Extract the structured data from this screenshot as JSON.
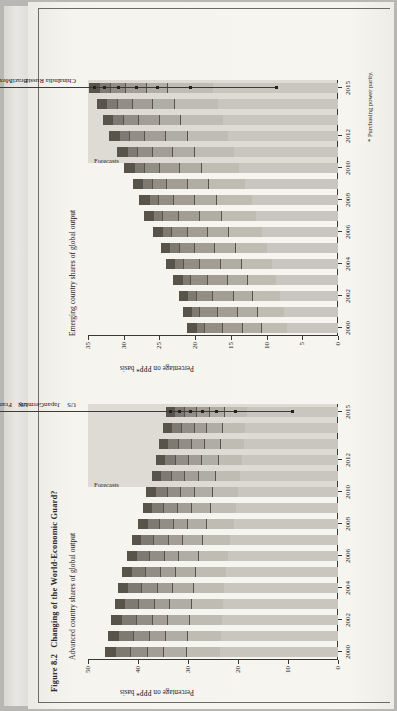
{
  "figure": {
    "number": "Figure 8.2",
    "caption": "Changing of the World-Economic Guard?"
  },
  "footnote": "* Purchasing power parity.",
  "panels": {
    "advanced": {
      "title": "Advanced country shares of global output",
      "ylabel": "Percentage on PPP* basis",
      "forecast_label": "Forecasts"
    },
    "emerging": {
      "title": "Emerging country shares of global output",
      "ylabel": "Percentage on PPP* basis",
      "forecast_label": "Forecasts"
    }
  },
  "chart_data": [
    {
      "id": "advanced",
      "type": "bar",
      "stacked": true,
      "title": "Advanced country shares of global output",
      "xlabel": "",
      "ylabel": "Percentage on PPP* basis",
      "ylim": [
        0,
        50
      ],
      "yticks": [
        0,
        10,
        20,
        30,
        40,
        50
      ],
      "grid": false,
      "legend": "leader-lines",
      "forecast_from": 2011,
      "x": [
        2000,
        2001,
        2002,
        2003,
        2004,
        2005,
        2006,
        2007,
        2008,
        2009,
        2010,
        2011,
        2012,
        2013,
        2014,
        2015
      ],
      "xticks": [
        2000,
        2002,
        2004,
        2006,
        2008,
        2010,
        2012,
        2015
      ],
      "categories": [
        "US",
        "Japan",
        "Germany",
        "UK",
        "France",
        "Italy",
        "Canada"
      ],
      "series": [
        {
          "name": "US",
          "values": [
            23.6,
            23.5,
            23.3,
            23.1,
            22.8,
            22.5,
            22.1,
            21.6,
            20.9,
            20.4,
            20.1,
            19.6,
            19.2,
            18.9,
            18.6,
            18.3
          ]
        },
        {
          "name": "Japan",
          "values": [
            6.9,
            6.7,
            6.5,
            6.4,
            6.3,
            6.1,
            5.9,
            5.7,
            5.5,
            5.3,
            5.2,
            5.0,
            4.8,
            4.7,
            4.6,
            4.5
          ]
        },
        {
          "name": "Germany",
          "values": [
            4.6,
            4.5,
            4.4,
            4.3,
            4.2,
            4.1,
            4.0,
            3.9,
            3.8,
            3.7,
            3.6,
            3.5,
            3.4,
            3.3,
            3.2,
            3.1
          ]
        },
        {
          "name": "UK",
          "values": [
            3.2,
            3.2,
            3.1,
            3.1,
            3.0,
            3.0,
            2.9,
            2.9,
            2.8,
            2.8,
            2.7,
            2.7,
            2.6,
            2.6,
            2.5,
            2.5
          ]
        },
        {
          "name": "France",
          "values": [
            3.3,
            3.2,
            3.2,
            3.1,
            3.1,
            3.0,
            2.9,
            2.9,
            2.8,
            2.8,
            2.7,
            2.6,
            2.6,
            2.5,
            2.5,
            2.4
          ]
        },
        {
          "name": "Italy",
          "values": [
            3.1,
            3.0,
            3.0,
            2.9,
            2.8,
            2.7,
            2.6,
            2.6,
            2.5,
            2.4,
            2.4,
            2.3,
            2.2,
            2.2,
            2.1,
            2.1
          ]
        },
        {
          "name": "Canada",
          "values": [
            1.9,
            1.9,
            1.9,
            1.8,
            1.8,
            1.8,
            1.8,
            1.7,
            1.7,
            1.7,
            1.7,
            1.6,
            1.6,
            1.6,
            1.6,
            1.5
          ]
        }
      ],
      "totals": [
        46.6,
        46.0,
        45.4,
        44.7,
        44.0,
        43.2,
        42.2,
        41.3,
        40.0,
        39.1,
        38.4,
        37.3,
        36.4,
        35.8,
        35.1,
        34.4
      ]
    },
    {
      "id": "emerging",
      "type": "bar",
      "stacked": true,
      "title": "Emerging country shares of global output",
      "xlabel": "",
      "ylabel": "Percentage on PPP* basis",
      "ylim": [
        0,
        35
      ],
      "yticks": [
        0,
        5,
        10,
        15,
        20,
        25,
        30,
        35
      ],
      "grid": false,
      "legend": "leader-lines",
      "forecast_from": 2011,
      "x": [
        2000,
        2001,
        2002,
        2003,
        2004,
        2005,
        2006,
        2007,
        2008,
        2009,
        2010,
        2011,
        2012,
        2013,
        2014,
        2015
      ],
      "xticks": [
        2000,
        2002,
        2004,
        2006,
        2008,
        2010,
        2012,
        2015
      ],
      "categories": [
        "China",
        "India",
        "Russia",
        "Brazil",
        "Mexico",
        "Indonesia",
        "Turkey"
      ],
      "series": [
        {
          "name": "China",
          "values": [
            7.1,
            7.6,
            8.1,
            8.7,
            9.3,
            9.9,
            10.7,
            11.5,
            12.1,
            13.0,
            13.8,
            14.6,
            15.4,
            16.1,
            16.8,
            17.5
          ]
        },
        {
          "name": "India",
          "values": [
            3.7,
            3.8,
            3.9,
            4.1,
            4.3,
            4.5,
            4.7,
            4.9,
            5.0,
            5.2,
            5.4,
            5.6,
            5.8,
            6.0,
            6.2,
            6.4
          ]
        },
        {
          "name": "Russia",
          "values": [
            2.6,
            2.7,
            2.7,
            2.8,
            2.9,
            2.9,
            3.0,
            3.1,
            3.1,
            3.0,
            3.0,
            3.0,
            3.0,
            3.0,
            3.0,
            3.0
          ]
        },
        {
          "name": "Brazil",
          "values": [
            2.9,
            2.9,
            2.9,
            2.8,
            2.9,
            2.8,
            2.8,
            2.9,
            2.9,
            2.9,
            2.9,
            2.9,
            2.9,
            2.9,
            2.9,
            2.9
          ]
        },
        {
          "name": "Mexico",
          "values": [
            2.4,
            2.4,
            2.3,
            2.3,
            2.3,
            2.2,
            2.2,
            2.2,
            2.1,
            2.0,
            2.1,
            2.1,
            2.1,
            2.1,
            2.1,
            2.1
          ]
        },
        {
          "name": "Indonesia",
          "values": [
            1.2,
            1.2,
            1.2,
            1.2,
            1.2,
            1.3,
            1.3,
            1.3,
            1.3,
            1.4,
            1.4,
            1.4,
            1.5,
            1.5,
            1.5,
            1.6
          ]
        },
        {
          "name": "Turkey",
          "values": [
            1.2,
            1.1,
            1.1,
            1.2,
            1.2,
            1.2,
            1.2,
            1.3,
            1.3,
            1.2,
            1.3,
            1.3,
            1.3,
            1.3,
            1.3,
            1.3
          ]
        }
      ],
      "totals": [
        21.1,
        21.7,
        22.2,
        23.1,
        24.1,
        24.8,
        25.9,
        27.2,
        27.8,
        28.7,
        29.9,
        30.9,
        32.0,
        32.9,
        33.8,
        34.8
      ]
    }
  ],
  "colors": {
    "page": "#f3f1ec",
    "ink": "#23211e",
    "forecast_band": "#dedbd4",
    "segments": [
      "#c9c6bf",
      "#bfbcb4",
      "#b0ada4",
      "#a29e95",
      "#928e85",
      "#7e7a71",
      "#585449"
    ]
  }
}
